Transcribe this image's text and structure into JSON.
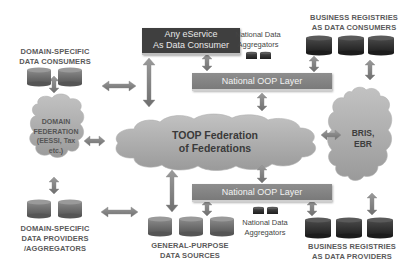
{
  "diagram": {
    "center_cloud": {
      "line1": "TOOP Federation",
      "line2": "of Federations"
    },
    "left_cloud": {
      "line1": "DOMAIN",
      "line2": "FEDERATION",
      "line3": "(EESSI, Tax",
      "line4": "etc.)"
    },
    "right_cloud": {
      "line1": "BRIS,",
      "line2": "EBR"
    },
    "eservice_box": {
      "line1": "Any eService",
      "line2": "As Data Consumer"
    },
    "oop_top": {
      "label": "National OOP Layer"
    },
    "oop_bottom": {
      "label": "National OOP Layer"
    },
    "aggregators_top": {
      "line1": "National Data",
      "line2": "Aggregators"
    },
    "aggregators_bottom": {
      "line1": "National Data",
      "line2": "Aggregators"
    },
    "domain_consumers": {
      "line1": "DOMAIN-SPECIFIC",
      "line2": "DATA CONSUMERS"
    },
    "domain_providers": {
      "line1": "DOMAIN-SPECIFIC",
      "line2": "DATA PROVIDERS",
      "line3": "/AGGREGATORS"
    },
    "general_sources": {
      "line1": "GENERAL-PURPOSE",
      "line2": "DATA SOURCES"
    },
    "br_consumers": {
      "line1": "BUSINESS REGISTRIES",
      "line2": "AS DATA CONSUMERS"
    },
    "br_providers": {
      "line1": "BUSINESS REGISTRIES",
      "line2": "AS DATA PROVIDERS"
    },
    "colors": {
      "dark_box": "#3f3f3f",
      "oop_bar": "#858585",
      "cloud": "#a8a8a8",
      "arrow": "#7f7f7f",
      "db_dark": "#2e2e2e",
      "db_mid": "#6a6a6a"
    }
  }
}
